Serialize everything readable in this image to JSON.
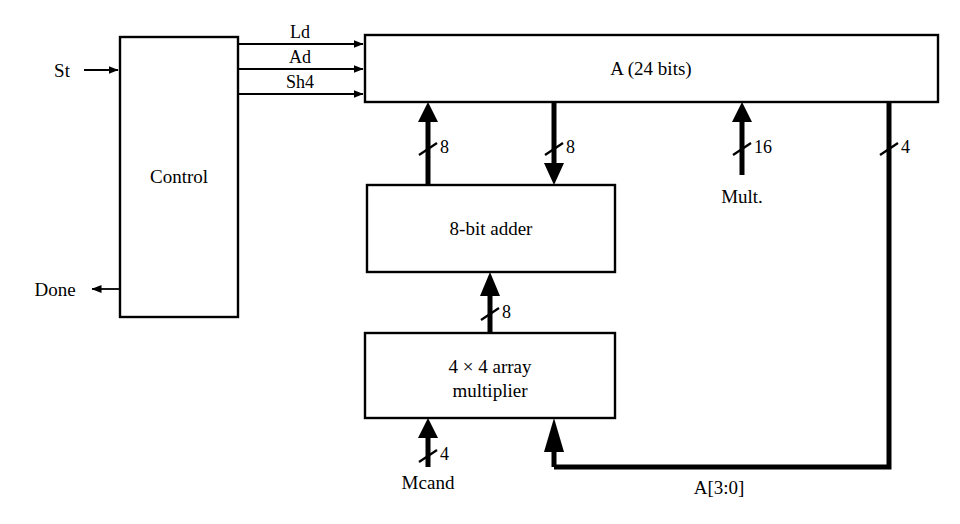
{
  "diagram": {
    "line_color": "#000000",
    "background": "#ffffff"
  },
  "blocks": [
    {
      "id": "control",
      "label": "Control",
      "x": 120,
      "y": 37,
      "w": 118,
      "h": 280
    },
    {
      "id": "a_register",
      "label": "A (24 bits)",
      "x": 365,
      "y": 35,
      "w": 573,
      "h": 67
    },
    {
      "id": "adder",
      "label": "8-bit adder",
      "x": 367,
      "y": 185,
      "w": 248,
      "h": 87
    },
    {
      "id": "multiplier",
      "label_line1": "4 × 4 array",
      "label_line2": "multiplier",
      "x": 365,
      "y": 333,
      "w": 250,
      "h": 85
    }
  ],
  "control_signals": [
    {
      "name": "Ld",
      "label": "Ld",
      "y": 44
    },
    {
      "name": "Ad",
      "label": "Ad",
      "y": 69
    },
    {
      "name": "Sh4",
      "label": "Sh4",
      "y": 94
    }
  ],
  "ports": [
    {
      "id": "st",
      "label": "St",
      "direction": "input",
      "x": 62,
      "y": 70
    },
    {
      "id": "done",
      "label": "Done",
      "direction": "output",
      "x": 55,
      "y": 289
    },
    {
      "id": "mult",
      "label": "Mult.",
      "direction": "input",
      "x": 742,
      "y": 196
    },
    {
      "id": "mcand",
      "label": "Mcand",
      "direction": "input",
      "x": 428,
      "y": 482
    }
  ],
  "buses": [
    {
      "id": "adder-to-a",
      "width_label": "8",
      "x": 428,
      "from": "8-bit adder",
      "to": "A (24 bits)"
    },
    {
      "id": "a-to-adder",
      "width_label": "8",
      "x": 554,
      "from": "A (24 bits)",
      "to": "8-bit adder"
    },
    {
      "id": "mult-input",
      "width_label": "16",
      "x": 742,
      "from": "Mult.",
      "to": "A (24 bits)"
    },
    {
      "id": "a-feedback",
      "width_label": "4",
      "x": 889,
      "from": "A (24 bits)",
      "to": "4 × 4 array multiplier"
    },
    {
      "id": "multiplier-to-adder",
      "width_label": "8",
      "x": 490,
      "from": "4 × 4 array multiplier",
      "to": "8-bit adder"
    },
    {
      "id": "mcand-input",
      "width_label": "4",
      "x": 428,
      "from": "Mcand",
      "to": "4 × 4 array multiplier"
    }
  ],
  "feedback_label": "A[3:0]"
}
